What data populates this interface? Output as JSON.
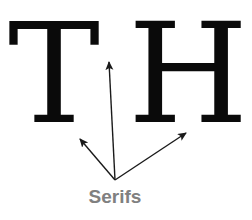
{
  "diagram": {
    "letters": [
      "T",
      "H"
    ],
    "caption": "Serifs",
    "colors": {
      "letters": "#0a0a0a",
      "arrows": "#1a1a1a",
      "caption": "#808080",
      "background": "#ffffff"
    },
    "arrows": [
      {
        "name": "arrow-to-t-arm-serif",
        "from": [
          115,
          180
        ],
        "to": [
          109,
          61
        ]
      },
      {
        "name": "arrow-to-t-foot-serif",
        "from": [
          115,
          180
        ],
        "to": [
          79,
          138
        ]
      },
      {
        "name": "arrow-to-h-foot-serif",
        "from": [
          115,
          180
        ],
        "to": [
          187,
          132
        ]
      }
    ]
  }
}
